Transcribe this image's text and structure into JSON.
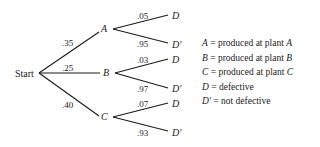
{
  "diagram": {
    "type": "probability-tree",
    "root": {
      "label": "Start"
    },
    "branches": [
      {
        "node": "A",
        "prob": ".35",
        "children": [
          {
            "node": "D",
            "prob": ".05"
          },
          {
            "node": "D′",
            "prob": ".95"
          }
        ]
      },
      {
        "node": "B",
        "prob": ".25",
        "children": [
          {
            "node": "D",
            "prob": ".03"
          },
          {
            "node": "D′",
            "prob": ".97"
          }
        ]
      },
      {
        "node": "C",
        "prob": ".40",
        "children": [
          {
            "node": "D",
            "prob": ".07"
          },
          {
            "node": "D′",
            "prob": ".93"
          }
        ]
      }
    ]
  },
  "legend": [
    {
      "symbol": "A",
      "eq": "=",
      "text": "produced at plant ",
      "suffix": "A"
    },
    {
      "symbol": "B",
      "eq": "=",
      "text": "produced at plant ",
      "suffix": "B"
    },
    {
      "symbol": "C",
      "eq": "=",
      "text": "produced at plant ",
      "suffix": "C"
    },
    {
      "symbol": "D",
      "eq": "=",
      "text": "defective",
      "suffix": ""
    },
    {
      "symbol": "D′",
      "eq": "=",
      "text": "not defective",
      "suffix": ""
    }
  ]
}
